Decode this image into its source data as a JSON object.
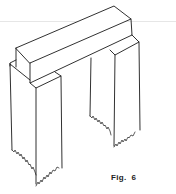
{
  "figure": {
    "caption": "Fig.  6",
    "line_color": "#1a1a1a",
    "background": "#ffffff"
  }
}
